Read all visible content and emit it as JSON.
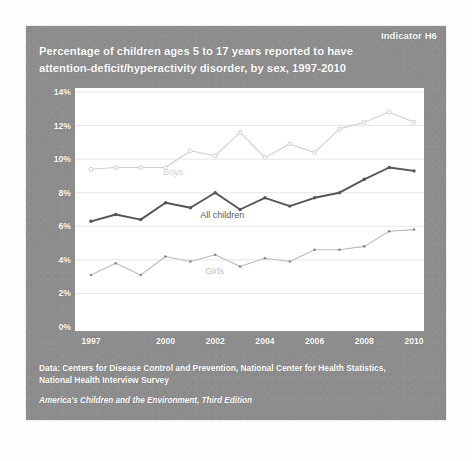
{
  "figure": {
    "indicator": "Indicator H6",
    "title_line1": "Percentage of children ages 5 to 17 years reported to have",
    "title_line2": "attention-deficit/hyperactivity disorder, by sex, 1997-2010",
    "source_line1": "Data: Centers for Disease Control and Prevention, National Center for Health Statistics,",
    "source_line2": "National Health Interview Survey",
    "publication": "America's Children and the Environment, Third Edition",
    "panel_color": "#8d8d8d",
    "plot_background": "#ffffff"
  },
  "chart_data": {
    "type": "line",
    "title": "Percentage of children ages 5 to 17 years reported to have attention-deficit/hyperactivity disorder, by sex, 1997-2010",
    "xlabel": "",
    "ylabel": "",
    "x": [
      1997,
      1998,
      1999,
      2000,
      2001,
      2002,
      2003,
      2004,
      2005,
      2006,
      2007,
      2008,
      2009,
      2010
    ],
    "xtick_labels": [
      "1997",
      "2000",
      "2002",
      "2004",
      "2006",
      "2008",
      "2010"
    ],
    "xtick_values": [
      1997,
      2000,
      2002,
      2004,
      2006,
      2008,
      2010
    ],
    "ytick_labels": [
      "0%",
      "2%",
      "4%",
      "6%",
      "8%",
      "10%",
      "12%",
      "14%"
    ],
    "ytick_values": [
      0,
      2,
      4,
      6,
      8,
      10,
      12,
      14
    ],
    "ylim": [
      0,
      14
    ],
    "xlim": [
      1997,
      2010
    ],
    "grid": true,
    "legend": "inline-labels",
    "series": [
      {
        "name": "Boys",
        "color": "#cfcfcf",
        "marker": "circle-open",
        "label_x": 1999.9,
        "label_y": 9.2,
        "values": [
          9.4,
          9.5,
          9.5,
          9.5,
          10.5,
          10.2,
          11.6,
          10.1,
          10.9,
          10.4,
          11.8,
          12.2,
          12.8,
          12.2
        ]
      },
      {
        "name": "All children",
        "color": "#555555",
        "marker": "circle-filled",
        "label_x": 2001.4,
        "label_y": 6.6,
        "values": [
          6.3,
          6.7,
          6.4,
          7.4,
          7.1,
          8.0,
          7.0,
          7.7,
          7.2,
          7.7,
          8.0,
          8.8,
          9.5,
          9.3
        ]
      },
      {
        "name": "Girls",
        "color": "#bbbbbb",
        "marker": "circle-small",
        "label_x": 2001.6,
        "label_y": 3.3,
        "values": [
          3.1,
          3.8,
          3.1,
          4.2,
          3.9,
          4.3,
          3.6,
          4.1,
          3.9,
          4.6,
          4.6,
          4.8,
          5.7,
          5.8
        ]
      }
    ]
  }
}
